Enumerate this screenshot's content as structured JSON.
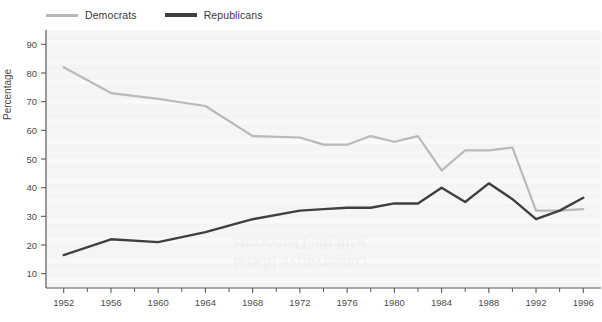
{
  "legend": {
    "position": "top-left",
    "items": [
      {
        "label": "Democrats",
        "color": "#b9b9b9",
        "name": "democrats"
      },
      {
        "label": "Republicans",
        "color": "#3f3f3f",
        "name": "republicans"
      }
    ]
  },
  "axes": {
    "ylabel": "Percentage",
    "xlabel": "",
    "y_ticks": [
      10,
      20,
      30,
      40,
      50,
      60,
      70,
      80,
      90
    ],
    "x_ticks": [
      1952,
      1956,
      1960,
      1964,
      1968,
      1972,
      1976,
      1980,
      1984,
      1988,
      1992,
      1996
    ],
    "x_minor_ticks": [
      1954,
      1958,
      1962,
      1966,
      1970,
      1974,
      1978,
      1982,
      1986,
      1990,
      1994
    ],
    "ylim": [
      5,
      95
    ],
    "xlim": [
      1950.5,
      1997.5
    ],
    "grid": false
  },
  "chart_data": {
    "type": "line",
    "title": "",
    "xlabel": "",
    "ylabel": "Percentage",
    "ylim": [
      5,
      95
    ],
    "xlim": [
      1950.5,
      1997.5
    ],
    "grid": false,
    "legend_position": "top-left",
    "x": [
      1952,
      1956,
      1960,
      1964,
      1968,
      1972,
      1974,
      1976,
      1978,
      1980,
      1982,
      1984,
      1986,
      1988,
      1990,
      1992,
      1994,
      1996
    ],
    "series": [
      {
        "name": "Democrats",
        "color": "#b9b9b9",
        "values": [
          82,
          73,
          71,
          68.5,
          58,
          57.5,
          55,
          55,
          58,
          56,
          58,
          46,
          53,
          53,
          54,
          32,
          32,
          32.5
        ]
      },
      {
        "name": "Republicans",
        "color": "#3f3f3f",
        "values": [
          16.5,
          22,
          21,
          24.5,
          29,
          32,
          32.5,
          33,
          33,
          34.5,
          34.5,
          40,
          35,
          41.5,
          36,
          29,
          32,
          36.5
        ]
      }
    ]
  },
  "watermark": {
    "lines": [
      "with the Democrats",
      "conservative liberal"
    ]
  },
  "colors": {
    "plot_background": "#f4f4f4",
    "axis": "#5a5a5a",
    "text": "#4d4d4d",
    "democrats": "#b9b9b9",
    "republicans": "#3f3f3f"
  }
}
